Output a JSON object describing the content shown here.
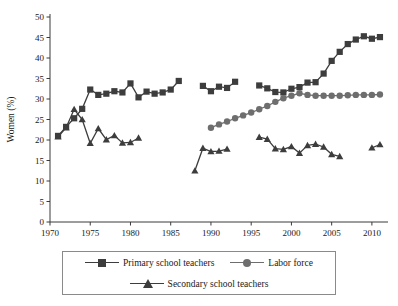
{
  "chart_data": {
    "type": "line",
    "title": "",
    "xlabel": "",
    "ylabel": "Women (%)",
    "xlim": [
      1970,
      2012
    ],
    "ylim": [
      0,
      50
    ],
    "xticks": [
      1970,
      1975,
      1980,
      1985,
      1990,
      1995,
      2000,
      2005,
      2010
    ],
    "yticks": [
      0,
      5,
      10,
      15,
      20,
      25,
      30,
      35,
      40,
      45,
      50
    ],
    "grid": false,
    "legend_position": "bottom",
    "series": [
      {
        "name": "Primary school teachers",
        "marker": "square",
        "color": "#3d3d3d",
        "segments": [
          {
            "x": [
              1971,
              1972,
              1973,
              1974,
              1975,
              1976,
              1977,
              1978,
              1979,
              1980,
              1981,
              1982,
              1983,
              1984,
              1985,
              1986
            ],
            "y": [
              21.0,
              23.2,
              25.3,
              27.6,
              32.3,
              31.0,
              31.3,
              31.9,
              31.6,
              33.8,
              30.4,
              31.8,
              31.3,
              31.6,
              32.3,
              34.4
            ]
          },
          {
            "x": [
              1989,
              1990,
              1991,
              1992,
              1993
            ],
            "y": [
              33.2,
              31.9,
              33.0,
              32.7,
              34.2
            ]
          },
          {
            "x": [
              1996,
              1997,
              1998,
              1999,
              2000,
              2001,
              2002,
              2003,
              2004,
              2005,
              2006,
              2007,
              2008,
              2009,
              2010,
              2011
            ],
            "y": [
              33.3,
              32.6,
              31.7,
              31.6,
              32.5,
              32.9,
              34.0,
              34.1,
              36.2,
              39.3,
              41.5,
              43.4,
              44.5,
              45.3,
              44.7,
              45.1
            ]
          }
        ]
      },
      {
        "name": "Labor force",
        "marker": "circle",
        "color": "#6e6e6e",
        "segments": [
          {
            "x": [
              1990,
              1991,
              1992,
              1993,
              1994,
              1995,
              1996,
              1997,
              1998,
              1999,
              2000,
              2001,
              2002,
              2003,
              2004,
              2005,
              2006,
              2007,
              2008,
              2009,
              2010,
              2011
            ],
            "y": [
              23.0,
              23.8,
              24.5,
              25.3,
              26.0,
              26.7,
              27.5,
              28.3,
              29.3,
              30.2,
              30.8,
              31.4,
              31.0,
              30.8,
              30.8,
              30.8,
              30.8,
              30.9,
              31.0,
              31.0,
              31.0,
              31.1
            ]
          }
        ]
      },
      {
        "name": "Secondary school teachers",
        "marker": "triangle",
        "color": "#3d3d3d",
        "segments": [
          {
            "x": [
              1971,
              1972,
              1973,
              1974,
              1975,
              1976,
              1977,
              1978,
              1979,
              1980,
              1981
            ],
            "y": [
              20.8,
              23.0,
              27.5,
              25.0,
              19.2,
              22.8,
              20.1,
              21.1,
              19.3,
              19.4,
              20.5
            ]
          },
          {
            "x": [
              1988,
              1989,
              1990,
              1991,
              1992
            ],
            "y": [
              12.5,
              18.0,
              17.2,
              17.3,
              17.8
            ]
          },
          {
            "x": [
              1996,
              1997,
              1998,
              1999,
              2000,
              2001,
              2002,
              2003,
              2004,
              2005,
              2006
            ],
            "y": [
              20.7,
              20.2,
              17.9,
              17.7,
              18.4,
              16.8,
              18.7,
              19.0,
              18.3,
              16.5,
              16.0
            ]
          },
          {
            "x": [
              2010,
              2011
            ],
            "y": [
              18.1,
              18.9
            ]
          }
        ]
      }
    ]
  },
  "legend": {
    "entries": [
      {
        "label": "Primary school teachers",
        "marker": "square",
        "color": "#3d3d3d"
      },
      {
        "label": "Labor force",
        "marker": "circle",
        "color": "#6e6e6e"
      },
      {
        "label": "Secondary school teachers",
        "marker": "triangle",
        "color": "#3d3d3d"
      }
    ]
  }
}
